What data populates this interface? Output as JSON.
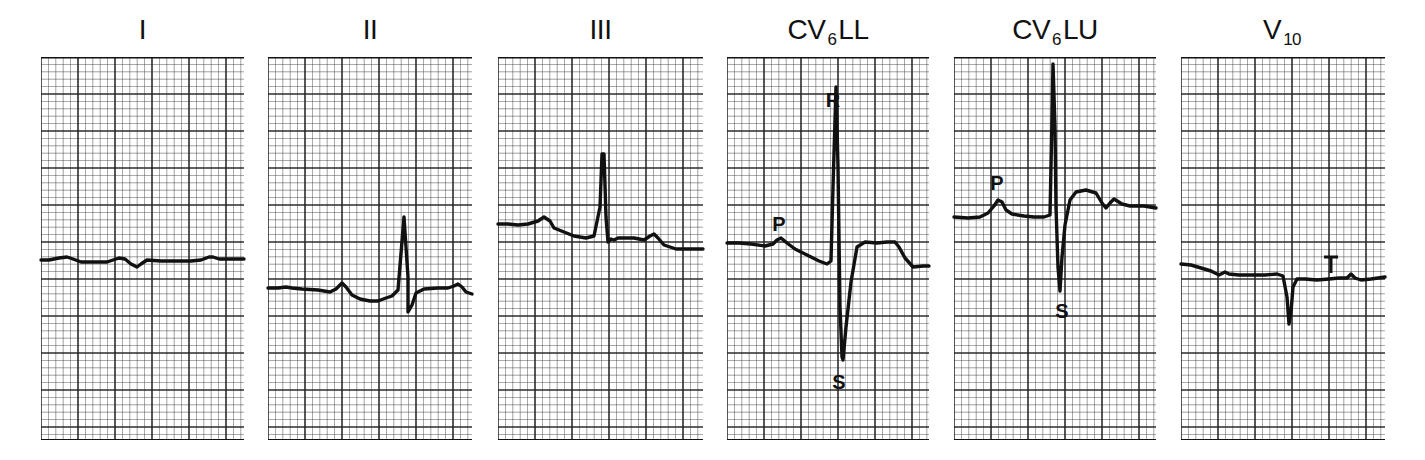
{
  "chart_data": {
    "type": "line",
    "title": "",
    "grid": {
      "small_box_px": 7.4,
      "large_box_px": 37,
      "color": "#222222"
    },
    "panels": [
      {
        "id": "I",
        "label": "I",
        "label_main": "I",
        "label_sub": "",
        "label_suffix": "",
        "x": 41,
        "width": 203,
        "trace": "0,203 8,203 18,201 26,200 32,202 40,205 52,205 66,205 78,201 84,202 90,207 96,210 100,207 106,203 120,204 140,204 150,204 160,203 168,200 172,200 178,202 190,202 203,202",
        "annotations": []
      },
      {
        "id": "II",
        "label": "II",
        "label_main": "II",
        "label_sub": "",
        "label_suffix": "",
        "x": 268,
        "width": 204,
        "trace": "0,231 10,231 18,230 24,231 34,232 50,233 62,235 68,232 74,226 78,230 84,238 92,242 102,244 110,244 118,241 124,239 130,233 136,160 140,220 140,255 144,248 148,236 156,232 170,231 180,231 186,229 190,227 194,230 198,235 204,237",
        "annotations": []
      },
      {
        "id": "III",
        "label": "III",
        "label_main": "III",
        "label_sub": "",
        "label_suffix": "",
        "x": 498,
        "width": 205,
        "trace": "0,167 10,167 20,168 30,167 40,164 46,160 52,164 56,171 66,175 76,179 88,181 96,179 102,150 104,97 106,97 108,160 110,185 113,182 116,183 120,181 136,181 146,183 152,179 156,177 160,181 166,188 178,192 190,192 205,192",
        "annotations": []
      },
      {
        "id": "CV6LL",
        "label": "CV6LL",
        "label_main": "CV",
        "label_sub": "6",
        "label_suffix": "LL",
        "x": 727,
        "width": 202,
        "trace": "0,186 12,186 24,187 38,189 46,187 50,183 54,181 60,186 68,192 80,198 92,204 100,207 104,204 106,130 109,30 111,110 113,250 115,300 116,303 119,270 124,225 130,190 138,185 150,186 160,185 168,185 172,190 178,201 186,210 196,209 202,209",
        "annotations": [
          {
            "text": "P",
            "x": 52,
            "y": 174
          },
          {
            "text": "R",
            "x": 106,
            "y": 50
          },
          {
            "text": "S",
            "x": 112,
            "y": 332
          }
        ]
      },
      {
        "id": "CV6LU",
        "label": "CV6LU",
        "label_main": "CV",
        "label_sub": "6",
        "label_suffix": "LU",
        "x": 954,
        "width": 202,
        "trace": "0,160 14,161 26,160 34,156 40,149 44,143 48,145 52,153 58,157 70,159 80,160 90,160 96,158 98,60 99,7 101,70 102,150 104,210 106,234 108,200 111,168 116,143 122,135 132,133 142,136 148,146 152,151 156,146 160,142 168,147 176,149 190,149 202,151",
        "annotations": [
          {
            "text": "P",
            "x": 43,
            "y": 133
          },
          {
            "text": "S",
            "x": 108,
            "y": 261
          }
        ]
      },
      {
        "id": "V10",
        "label": "V10",
        "label_main": "V",
        "label_sub": "10",
        "label_suffix": "",
        "x": 1181,
        "width": 204,
        "trace": "0,207 10,208 20,211 30,214 38,218 44,215 48,217 58,218 70,218 84,218 96,217 102,219 106,240 108,267 110,255 112,230 116,222 124,222 136,223 148,222 158,221 166,221 170,217 174,221 180,223 190,222 204,220",
        "annotations": [
          {
            "text": "T",
            "x": 150,
            "y": 200
          }
        ]
      }
    ],
    "axis_ranges": {
      "plot_top_px": 57,
      "plot_bottom_px": 440
    },
    "legend": "none"
  }
}
